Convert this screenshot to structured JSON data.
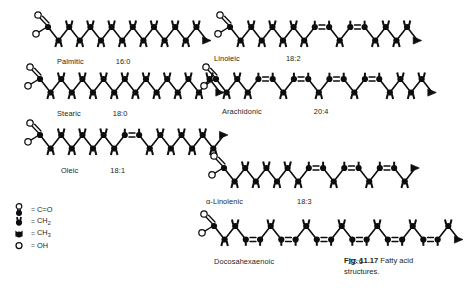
{
  "figure": {
    "caption_id": "Fig. 11.17",
    "caption_text": "Fatty acid structures."
  },
  "legend": {
    "items": [
      {
        "symbol": "carbonyl-symbol",
        "equals": "=",
        "label": "C=O"
      },
      {
        "symbol": "ch2-symbol",
        "equals": "=",
        "label": "CH2"
      },
      {
        "symbol": "ch3-symbol",
        "equals": "=",
        "label": "CH3"
      },
      {
        "symbol": "oh-symbol",
        "equals": "=",
        "label": "OH"
      }
    ]
  },
  "molecules": [
    {
      "id": "palmitic",
      "name": "Palmitic",
      "ratio": "16:0",
      "carbons": 16,
      "double_bonds": [],
      "column": "left",
      "x": 30,
      "y": 14,
      "label_x": 57,
      "label_y": 57,
      "label_gap": 32
    },
    {
      "id": "stearic",
      "name": "Stearic",
      "ratio": "18:0",
      "carbons": 18,
      "double_bonds": [],
      "column": "left",
      "x": 22,
      "y": 66,
      "label_x": 57,
      "label_y": 109,
      "label_gap": 32
    },
    {
      "id": "oleic",
      "name": "Oleic",
      "ratio": "18:1",
      "carbons": 18,
      "double_bonds": [
        9
      ],
      "column": "left",
      "x": 22,
      "y": 122,
      "label_x": 61,
      "label_y": 166,
      "label_gap": 32
    },
    {
      "id": "linoleic",
      "name": "Linoleic",
      "ratio": "18:2",
      "carbons": 18,
      "double_bonds": [
        9,
        12
      ],
      "column": "right",
      "x": 212,
      "y": 14,
      "label_x": 214,
      "label_y": 54,
      "label_gap": 46
    },
    {
      "id": "arachidonic",
      "name": "Arachidonic",
      "ratio": "20:4",
      "carbons": 20,
      "double_bonds": [
        5,
        8,
        11,
        14
      ],
      "column": "right",
      "x": 198,
      "y": 66,
      "label_x": 222,
      "label_y": 107,
      "label_gap": 52
    },
    {
      "id": "alpha-linolenic",
      "name": "α-Linolenic",
      "ratio": "18:3",
      "carbons": 18,
      "double_bonds": [
        9,
        12,
        15
      ],
      "column": "right",
      "x": 206,
      "y": 155,
      "label_x": 206,
      "label_y": 197,
      "label_gap": 54
    },
    {
      "id": "docosahexaenoic",
      "name": "Docosahexaenoic",
      "ratio": "22:6",
      "carbons": 22,
      "double_bonds": [
        4,
        7,
        10,
        13,
        16,
        19
      ],
      "column": "right",
      "x": 196,
      "y": 213,
      "label_x": 214,
      "label_y": 257,
      "label_gap": 74
    }
  ],
  "style": {
    "ink": "#0d0d0d",
    "bond_width": 1.6,
    "node_radius": 3.1,
    "open_radius": 3.0,
    "step_x": 10.6,
    "step_y": 13.5
  }
}
